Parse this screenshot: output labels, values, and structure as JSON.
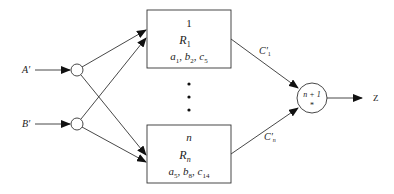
{
  "diagram": {
    "inputs": [
      {
        "id": "a",
        "label": "A′"
      },
      {
        "id": "b",
        "label": "B′"
      }
    ],
    "rule_boxes": [
      {
        "index": "1",
        "rule": "R",
        "rule_sub": "1",
        "params": [
          {
            "b": "a",
            "s": "1"
          },
          {
            "b": "b",
            "s": "2"
          },
          {
            "b": "c",
            "s": "5"
          }
        ]
      },
      {
        "index": "n",
        "rule": "R",
        "rule_sub": "n",
        "params": [
          {
            "b": "a",
            "s": "5"
          },
          {
            "b": "b",
            "s": "8"
          },
          {
            "b": "c",
            "s": "14"
          }
        ]
      }
    ],
    "ellipsis": "⋮",
    "edges": [
      {
        "label": "C′",
        "sub": "1"
      },
      {
        "label": "C′",
        "sub": "n"
      }
    ],
    "aggregator": {
      "top": "n + 1",
      "bottom": "*"
    },
    "output": {
      "label": "Z"
    },
    "colors": {
      "stroke": "#333333",
      "text": "#222222",
      "background": "#ffffff"
    }
  }
}
